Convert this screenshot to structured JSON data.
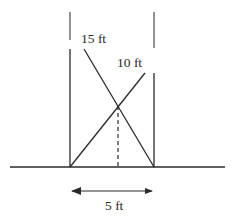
{
  "diagram": {
    "labels": {
      "ladder_long": "15 ft",
      "ladder_short": "10 ft",
      "width": "5 ft"
    },
    "colors": {
      "line": "#2a2a2a",
      "background": "#ffffff"
    }
  }
}
